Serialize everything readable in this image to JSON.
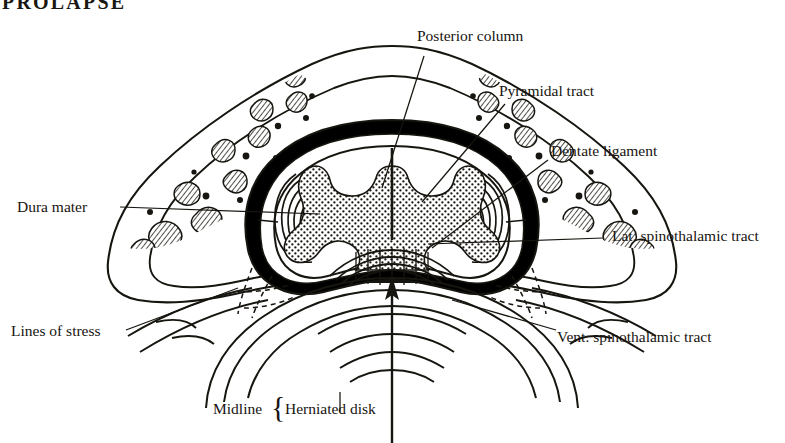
{
  "figure": {
    "title": "PROLAPSE",
    "kind": "anatomical-cross-section"
  },
  "labels": {
    "posterior_column": "Posterior column",
    "pyramidal_tract": "Pyramidal tract",
    "dentate_ligament": "Dentate ligament",
    "lat_spinothalamic_tract": "Lat. spinothalamic tract",
    "vent_spinothalamic_tract": "Vent. spinothalamic tract",
    "dura_mater": "Dura mater",
    "lines_of_stress": "Lines of stress",
    "midline": "Midline",
    "herniated_disk": "Herniated disk",
    "brace": "{"
  },
  "colors": {
    "ink": "#17150f",
    "paper": "#ffffff",
    "dura_fill": "#000000",
    "stipple": "#17150f"
  }
}
